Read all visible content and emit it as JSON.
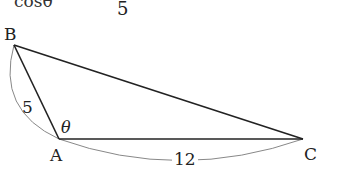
{
  "header": {
    "cut_text": "cosθ",
    "denominator": "5"
  },
  "triangle": {
    "vertices": {
      "A": {
        "label": "A",
        "x": 59,
        "y": 139
      },
      "B": {
        "label": "B",
        "x": 14,
        "y": 45
      },
      "C": {
        "label": "C",
        "x": 303,
        "y": 139
      }
    },
    "sides": {
      "AB": "5",
      "AC": "12"
    },
    "angle_label": "θ",
    "line_color": "#222222",
    "arc_color": "#888888"
  }
}
